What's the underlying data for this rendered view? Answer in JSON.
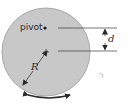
{
  "diagram": {
    "type": "physical-pendulum-disk",
    "labels": {
      "pivot": "pivot",
      "distance": "d",
      "radius": "R"
    },
    "colors": {
      "disk_fill": "#c8c8c8",
      "disk_stroke": "#9a9a9a",
      "lines": "#3a3a3a",
      "background": "#ffffff"
    },
    "elements": [
      {
        "name": "disk",
        "shape": "circle",
        "cx": 46,
        "cy": 52,
        "r": 44
      },
      {
        "name": "pivot-point",
        "shape": "dot",
        "x": 45,
        "y": 28
      },
      {
        "name": "center-point",
        "shape": "cross",
        "x": 46,
        "y": 52
      },
      {
        "name": "pivot-reference-line",
        "shape": "line",
        "y": 28
      },
      {
        "name": "center-reference-line",
        "shape": "line",
        "y": 51
      },
      {
        "name": "d-dimension-arrow",
        "shape": "double-arrow",
        "x": 105
      },
      {
        "name": "radius-arrow",
        "shape": "arrow",
        "from": [
          46,
          52
        ],
        "to": [
          23,
          85
        ]
      },
      {
        "name": "rotation-arrow",
        "shape": "double-arc-arrow"
      }
    ]
  }
}
